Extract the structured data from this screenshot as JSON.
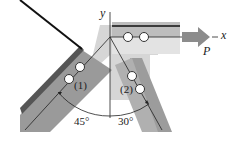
{
  "diagram": {
    "axes": {
      "x_label": "x",
      "y_label": "y"
    },
    "load": {
      "label": "P",
      "direction": "+x"
    },
    "members": [
      {
        "id": "member-1",
        "label": "(1)",
        "angle_from_vertical_deg": 45,
        "side": "left"
      },
      {
        "id": "member-2",
        "label": "(2)",
        "angle_from_vertical_deg": 30,
        "side": "right"
      }
    ],
    "angles": {
      "left": "45°",
      "right": "30°"
    },
    "colors": {
      "plate_light": "#d9d9d9",
      "plate_mid": "#a6a6a6",
      "plate_dark": "#7f7f7f",
      "arrow": "#8c8c8c",
      "line": "#222222"
    }
  }
}
